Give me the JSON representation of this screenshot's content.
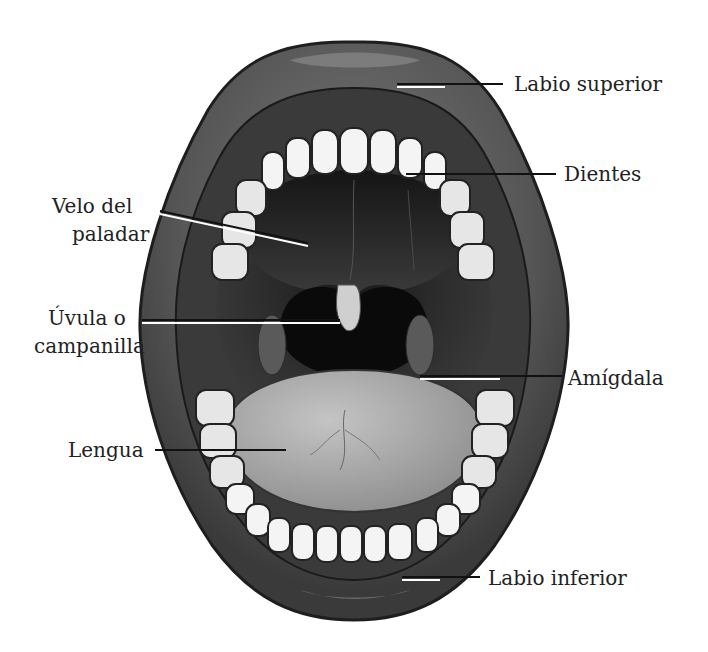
{
  "diagram": {
    "labels": [
      {
        "id": "labio-superior",
        "text": "Labio superior",
        "x": 514,
        "y": 72,
        "align": "left"
      },
      {
        "id": "dientes",
        "text": "Dientes",
        "x": 564,
        "y": 164,
        "align": "left"
      },
      {
        "id": "velo-paladar-1",
        "text": "Velo del",
        "x": 52,
        "y": 196,
        "align": "left"
      },
      {
        "id": "velo-paladar-2",
        "text": "paladar",
        "x": 72,
        "y": 224,
        "align": "left"
      },
      {
        "id": "uvula-1",
        "text": "Úvula o",
        "x": 48,
        "y": 306,
        "align": "left"
      },
      {
        "id": "uvula-2",
        "text": "campanilla",
        "x": 34,
        "y": 336,
        "align": "left"
      },
      {
        "id": "amigdala",
        "text": "Amígdala",
        "x": 568,
        "y": 370,
        "align": "left"
      },
      {
        "id": "lengua",
        "text": "Lengua",
        "x": 68,
        "y": 440,
        "align": "left"
      },
      {
        "id": "labio-inferior",
        "text": "Labio inferior",
        "x": 488,
        "y": 566,
        "align": "left"
      }
    ],
    "colors": {
      "outer_lip": "#5a5a5a",
      "lip_highlight": "#8a8a8a",
      "gum": "#3e3e3e",
      "cavity": "#141414",
      "palate": "#2a2a2a",
      "tongue": "#a8a8a8",
      "tooth": "#f4f4f4",
      "tooth_outline": "#222222",
      "leader_line": "#111111"
    }
  }
}
